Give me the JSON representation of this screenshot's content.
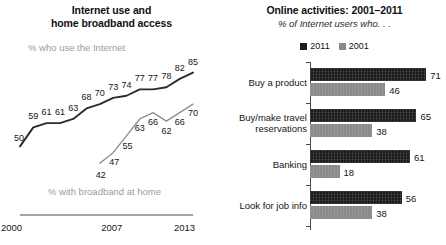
{
  "line_panel": {
    "title_line1": "Internet use and",
    "title_line2": "home broadband access",
    "note_internet": "% who use the Internet",
    "note_broadband": "% with broadband at home",
    "axis_labels": [
      "2000",
      "2007",
      "2013"
    ]
  },
  "bars_panel": {
    "title": "Online activities: 2001–2011",
    "subtitle": "% of Internet users who. . .",
    "legend": [
      {
        "label": "2011",
        "color": "#1c1c1c"
      },
      {
        "label": "2001",
        "color": "#8a8a8a"
      }
    ]
  },
  "chart_data": [
    {
      "type": "line",
      "title": "Internet use and home broadband access",
      "xlabel": "",
      "ylabel": "",
      "ylim": [
        35,
        90
      ],
      "grid": false,
      "legend_position": "inline-annotation",
      "x": [
        2000,
        2001,
        2002,
        2003,
        2004,
        2005,
        2006,
        2007,
        2008,
        2009,
        2010,
        2011,
        2012,
        2013
      ],
      "xticks": [
        "2000",
        "2007",
        "2013"
      ],
      "series": [
        {
          "name": "% who use the Internet",
          "color": "#2b2b2b",
          "x": [
            2000,
            2001,
            2002,
            2003,
            2004,
            2005,
            2006,
            2007,
            2008,
            2009,
            2010,
            2011,
            2012,
            2013
          ],
          "values": [
            50,
            59,
            61,
            61,
            63,
            68,
            70,
            73,
            74,
            77,
            77,
            78,
            82,
            85
          ]
        },
        {
          "name": "% with broadband at home",
          "color": "#8f8f8f",
          "x": [
            2006,
            2007,
            2008,
            2009,
            2010,
            2011,
            2012,
            2013
          ],
          "values": [
            42,
            47,
            55,
            63,
            66,
            62,
            66,
            70
          ]
        }
      ]
    },
    {
      "type": "bar",
      "orientation": "horizontal",
      "title": "Online activities: 2001–2011",
      "subtitle": "% of Internet users who. . .",
      "xlabel": "",
      "ylabel": "",
      "xlim": [
        0,
        80
      ],
      "grid": false,
      "legend_position": "top-center",
      "categories": [
        "Buy a product",
        "Buy/make travel reservations",
        "Banking",
        "Look for job info"
      ],
      "series": [
        {
          "name": "2011",
          "color": "#1c1c1c",
          "values": [
            71,
            65,
            61,
            56
          ]
        },
        {
          "name": "2001",
          "color": "#8a8a8a",
          "values": [
            46,
            38,
            18,
            38
          ]
        }
      ]
    }
  ]
}
